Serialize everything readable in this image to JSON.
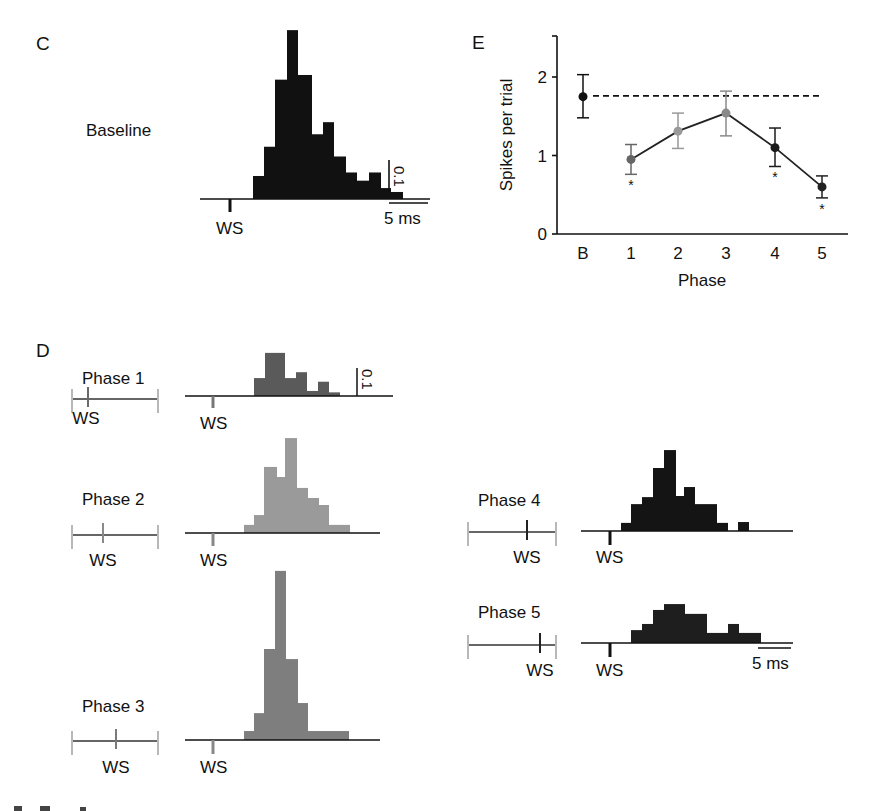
{
  "panels": {
    "C": {
      "letter": "C",
      "label": "Baseline"
    },
    "D": {
      "letter": "D"
    },
    "E": {
      "letter": "E"
    }
  },
  "labels": {
    "ws": "WS",
    "scale_time": "5 ms",
    "scale_prob": "0.1"
  },
  "colors": {
    "baseline": "#111111",
    "phase1": "#5a5a5a",
    "phase2": "#9a9a9a",
    "phase3": "#7e7e7e",
    "phase4": "#141414",
    "phase5": "#1e1e1e",
    "timeline_end": "#b8b8b8"
  },
  "chart_data": [
    {
      "id": "C-baseline",
      "type": "bar",
      "title": "Baseline",
      "xlabel": "time after WS (bins ~1 ms, 5 ms scale bar)",
      "ylabel": "probability (0.1 scale bar)",
      "bin_edges_px": [
        253,
        264,
        275,
        287,
        298,
        312,
        323,
        334,
        346,
        357,
        369,
        381,
        391,
        403
      ],
      "values": [
        0.059,
        0.134,
        0.306,
        0.433,
        0.318,
        0.166,
        0.197,
        0.109,
        0.068,
        0.047,
        0.068,
        0.028,
        0.018
      ],
      "units_per_0_1": 39
    },
    {
      "id": "D-phase1",
      "type": "bar",
      "title": "Phase 1",
      "bin_edges_px": [
        254,
        265,
        285,
        296,
        307,
        318,
        329,
        340
      ],
      "values": [
        0.064,
        0.154,
        0.064,
        0.085,
        0.018,
        0.051,
        0.013
      ],
      "units_per_0_1": 28
    },
    {
      "id": "D-phase2",
      "type": "bar",
      "title": "Phase 2",
      "bin_edges_px": [
        244,
        254,
        264,
        277,
        285,
        297,
        308,
        319,
        329,
        350
      ],
      "values": [
        0.029,
        0.064,
        0.236,
        0.2,
        0.339,
        0.161,
        0.125,
        0.1,
        0.029
      ],
      "units_per_0_1": 28
    },
    {
      "id": "D-phase3",
      "type": "bar",
      "title": "Phase 3",
      "bin_edges_px": [
        244,
        254,
        264,
        275,
        286,
        298,
        308,
        349
      ],
      "values": [
        0.032,
        0.096,
        0.325,
        0.604,
        0.289,
        0.132,
        0.032
      ],
      "units_per_0_1": 28
    },
    {
      "id": "D-phase4",
      "type": "bar",
      "title": "Phase 4",
      "bin_edges_px": [
        621,
        631,
        642,
        653,
        664,
        676,
        684,
        695,
        707,
        717,
        728,
        738,
        749
      ],
      "values": [
        0.029,
        0.096,
        0.121,
        0.225,
        0.289,
        0.125,
        0.157,
        0.096,
        0.096,
        0.029,
        0,
        0.032
      ],
      "units_per_0_1": 28
    },
    {
      "id": "D-phase5",
      "type": "bar",
      "title": "Phase 5",
      "bin_edges_px": [
        631,
        642,
        653,
        664,
        685,
        707,
        728,
        739,
        761
      ],
      "values": [
        0.046,
        0.068,
        0.118,
        0.139,
        0.104,
        0.036,
        0.068,
        0.036
      ],
      "units_per_0_1": 28
    },
    {
      "id": "E-spikes",
      "type": "line",
      "title": "",
      "xlabel": "Phase",
      "ylabel": "Spikes per trial",
      "categories": [
        "B",
        "1",
        "2",
        "3",
        "4",
        "5"
      ],
      "values": [
        1.75,
        0.95,
        1.31,
        1.54,
        1.1,
        0.6
      ],
      "error_low": [
        1.48,
        0.76,
        1.09,
        1.25,
        0.86,
        0.46
      ],
      "error_high": [
        2.03,
        1.14,
        1.54,
        1.82,
        1.35,
        0.74
      ],
      "significant": [
        false,
        true,
        false,
        false,
        true,
        true
      ],
      "significance_marker": "*",
      "reference_line": {
        "value": 1.76,
        "style": "dashed"
      },
      "yticks": [
        0,
        1,
        2
      ],
      "ylim": [
        0,
        2.5
      ],
      "grid": false
    }
  ],
  "timelines": [
    {
      "phase": "Phase 1",
      "x0": 72,
      "x1": 158,
      "tick": 88,
      "y": 399,
      "label_y": 384,
      "ws_x": 86,
      "ws_y": 424
    },
    {
      "phase": "Phase 2",
      "x0": 72,
      "x1": 158,
      "tick": 103,
      "y": 535,
      "label_y": 505,
      "ws_x": 103,
      "ws_y": 566
    },
    {
      "phase": "Phase 3",
      "x0": 72,
      "x1": 158,
      "tick": 116,
      "y": 741,
      "label_y": 712,
      "ws_x": 116,
      "ws_y": 773
    },
    {
      "phase": "Phase 4",
      "x0": 468,
      "x1": 556,
      "tick": 527,
      "y": 532,
      "label_y": 506,
      "ws_x": 527,
      "ws_y": 563
    },
    {
      "phase": "Phase 5",
      "x0": 468,
      "x1": 556,
      "tick": 540,
      "y": 645,
      "label_y": 618,
      "ws_x": 540,
      "ws_y": 676
    }
  ]
}
